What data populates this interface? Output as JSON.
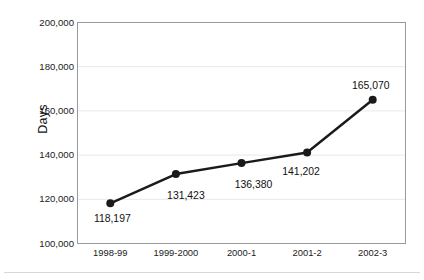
{
  "chart_data": {
    "type": "line",
    "title": "",
    "subtitle": "",
    "xlabel": "",
    "ylabel": "Days",
    "categories": [
      "1998-99",
      "1999-2000",
      "2000-1",
      "2001-2",
      "2002-3"
    ],
    "values": [
      118197,
      131423,
      136380,
      141202,
      165070
    ],
    "value_labels": [
      "118,197",
      "131,423",
      "136,380",
      "141,202",
      "165,070"
    ],
    "series": [
      {
        "name": "Days",
        "values": [
          118197,
          131423,
          136380,
          141202,
          165070
        ]
      }
    ],
    "ylim": [
      100000,
      200000
    ],
    "ytick_values": [
      100000,
      120000,
      140000,
      160000,
      180000,
      200000
    ],
    "ytick_labels": [
      "100,000",
      "120,000",
      "140,000",
      "160,000",
      "180,000",
      "200,000"
    ],
    "grid": true,
    "grid_axis": "y",
    "legend": false,
    "legend_position": "none",
    "marker": "filled-circle",
    "colors": {
      "line": "#1a1a1a",
      "marker": "#1a1a1a",
      "grid": "#e8e8e8",
      "axis": "#9a9a9a",
      "text": "#1a1a1a",
      "background": "#ffffff"
    }
  },
  "axis": {
    "y_title": "Days"
  }
}
